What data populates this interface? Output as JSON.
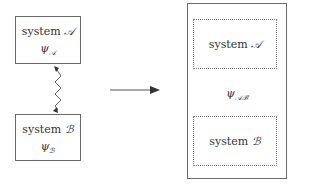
{
  "left": {
    "system_a": {
      "label": "system",
      "name": "𝒜",
      "state_symbol": "ψ",
      "state_sub": "𝒜"
    },
    "system_b": {
      "label": "system",
      "name": "ℬ",
      "state_symbol": "ψ",
      "state_sub": "ℬ"
    },
    "link": {
      "style": "wavy",
      "arrowheads": "both"
    }
  },
  "arrow": {
    "direction": "right"
  },
  "right": {
    "outer_state_symbol": "ψ",
    "outer_state_sub": "𝒜ℬ",
    "inner_a": {
      "label": "system",
      "name": "𝒜"
    },
    "inner_b": {
      "label": "system",
      "name": "ℬ"
    }
  },
  "colors": {
    "line": "#6a6a6a",
    "text": "#333333",
    "arrow": "#444444"
  }
}
